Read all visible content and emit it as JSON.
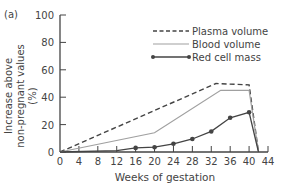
{
  "panel_label": "(a)",
  "chart_data": {
    "type": "line",
    "title": "",
    "xlabel": "Weeks of gestation",
    "ylabel": "Increase above non-pregnant values (%)",
    "ylabel_lines": [
      "Increase above",
      "non-pregnant values (%)"
    ],
    "xlim": [
      0,
      44
    ],
    "ylim": [
      0,
      100
    ],
    "xticks": [
      0,
      4,
      8,
      12,
      16,
      20,
      24,
      28,
      32,
      36,
      40,
      44
    ],
    "yticks": [
      0,
      20,
      40,
      60,
      80,
      100
    ],
    "grid": false,
    "legend_position": "upper right",
    "series": [
      {
        "name": "Plasma volume",
        "style": "dashed",
        "color": "#444444",
        "markers": false,
        "x": [
          0,
          33,
          40,
          42
        ],
        "y": [
          0,
          50,
          49,
          0
        ]
      },
      {
        "name": "Blood volume",
        "style": "solid-light",
        "color": "#a0a0a0",
        "markers": false,
        "x": [
          0,
          20,
          34,
          40,
          42
        ],
        "y": [
          0,
          14,
          45,
          45,
          0
        ]
      },
      {
        "name": "Red cell mass",
        "style": "solid-markers",
        "color": "#444444",
        "markers": true,
        "x": [
          0,
          12,
          16,
          20,
          24,
          28,
          32,
          36,
          40,
          42
        ],
        "y": [
          0,
          1,
          3,
          3.5,
          6,
          9.5,
          15,
          25,
          29,
          0
        ],
        "marker_x": [
          16,
          20,
          24,
          28,
          32,
          36,
          40
        ],
        "marker_y": [
          3,
          3.5,
          6,
          9.5,
          15,
          25,
          29
        ]
      }
    ]
  }
}
